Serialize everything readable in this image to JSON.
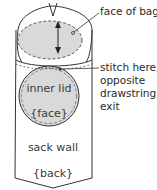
{
  "diagram": {
    "labels": {
      "face_of_bag": "face of bag",
      "stitch_line1": "stitch here,",
      "stitch_line2": "opposite",
      "stitch_line3": "drawstring",
      "stitch_line4": "exit",
      "inner_lid": "inner lid",
      "face_tag": "{face}",
      "sack_wall": "sack wall",
      "back_tag": "{back}"
    },
    "colors": {
      "line": "#333333",
      "fill_gray": "#d9d9d9",
      "background": "#ffffff"
    }
  }
}
